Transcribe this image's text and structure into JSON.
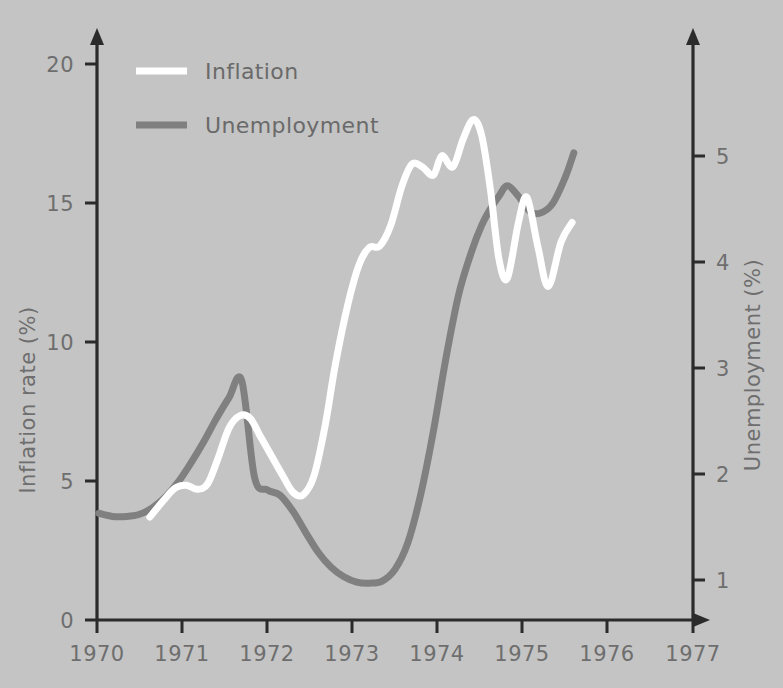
{
  "chart_data": {
    "type": "line",
    "title": "",
    "subtitle": "",
    "xlabel": "",
    "ylabel": "Inflation rate (%)",
    "y2label": "Unemployment (%)",
    "xlim": [
      1970,
      1977
    ],
    "ylim": [
      0,
      21.5
    ],
    "y2lim": [
      0,
      5.8
    ],
    "grid": false,
    "legend_position": "top-left",
    "background_color": "#c4c4c4",
    "x_ticks": [
      "1970",
      "1971",
      "1972",
      "1973",
      "1974",
      "1975",
      "1976",
      "1977"
    ],
    "y_ticks": [
      "0",
      "5",
      "10",
      "15",
      "20"
    ],
    "y2_ticks": [
      "1",
      "2",
      "3",
      "4",
      "5"
    ],
    "series": [
      {
        "name": "Inflation",
        "color": "#ffffff",
        "axis": "left",
        "x": [
          1970.62,
          1970.78,
          1970.92,
          1971.05,
          1971.18,
          1971.3,
          1971.42,
          1971.55,
          1971.68,
          1971.8,
          1971.92,
          1972.05,
          1972.18,
          1972.3,
          1972.42,
          1972.55,
          1972.68,
          1972.8,
          1972.95,
          1973.08,
          1973.2,
          1973.32,
          1973.45,
          1973.58,
          1973.7,
          1973.82,
          1973.95,
          1974.05,
          1974.18,
          1974.3,
          1974.42,
          1974.52,
          1974.62,
          1974.72,
          1974.82,
          1974.95,
          1975.05,
          1975.18,
          1975.3,
          1975.45,
          1975.58
        ],
        "values": [
          3.7,
          4.3,
          4.75,
          4.85,
          4.7,
          4.9,
          5.8,
          6.9,
          7.35,
          7.25,
          6.6,
          5.9,
          5.2,
          4.6,
          4.5,
          5.2,
          7.0,
          9.2,
          11.4,
          12.8,
          13.4,
          13.45,
          14.2,
          15.6,
          16.4,
          16.3,
          16.0,
          16.7,
          16.3,
          17.3,
          18.0,
          17.4,
          15.5,
          13.0,
          12.3,
          14.3,
          15.2,
          13.4,
          12.0,
          13.6,
          14.3
        ]
      },
      {
        "name": "Unemployment",
        "color": "#808080",
        "axis": "right",
        "x": [
          1970.02,
          1970.18,
          1970.35,
          1970.5,
          1970.65,
          1970.8,
          1970.95,
          1971.1,
          1971.25,
          1971.4,
          1971.55,
          1971.7,
          1971.85,
          1972.0,
          1972.15,
          1972.3,
          1972.45,
          1972.6,
          1972.75,
          1972.9,
          1973.05,
          1973.2,
          1973.35,
          1973.5,
          1973.65,
          1973.8,
          1973.95,
          1974.1,
          1974.25,
          1974.4,
          1974.52,
          1974.62,
          1974.72,
          1974.82,
          1974.95,
          1975.08,
          1975.2,
          1975.35,
          1975.5,
          1975.6
        ],
        "values": [
          1.63,
          1.6,
          1.6,
          1.62,
          1.68,
          1.78,
          1.92,
          2.1,
          2.3,
          2.52,
          2.72,
          2.88,
          1.97,
          1.85,
          1.8,
          1.65,
          1.45,
          1.26,
          1.12,
          1.03,
          0.98,
          0.97,
          0.99,
          1.1,
          1.35,
          1.8,
          2.4,
          3.1,
          3.7,
          4.1,
          4.35,
          4.5,
          4.62,
          4.72,
          4.62,
          4.48,
          4.46,
          4.55,
          4.8,
          5.03
        ]
      }
    ]
  },
  "legend": {
    "items": [
      {
        "label": "Inflation",
        "color": "#ffffff"
      },
      {
        "label": "Unemployment",
        "color": "#808080"
      }
    ]
  },
  "axes": {
    "left_title": "Inflation rate (%)",
    "right_title": "Unemployment (%)"
  }
}
